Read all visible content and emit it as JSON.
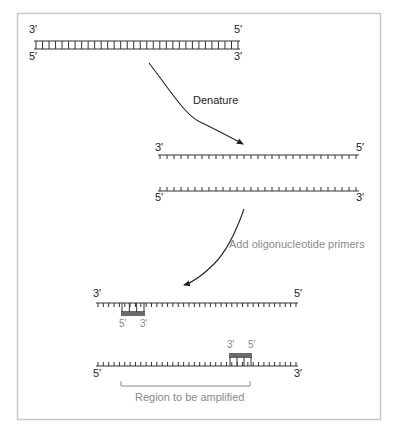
{
  "diagram": {
    "colors": {
      "strand": "#333333",
      "primer": "#6b6b6b",
      "frame": "#c8c8c8",
      "gray_text": "#8a8a8a"
    },
    "stage1": {
      "name": "double-stranded DNA",
      "top_left_label": "3′",
      "top_right_label": "5′",
      "bottom_left_label": "5′",
      "bottom_right_label": "3′",
      "base_pairs": 32
    },
    "step1": {
      "label": "Denature"
    },
    "stage2": {
      "name": "separated single strands",
      "strand_a": {
        "left_label": "3′",
        "right_label": "5′",
        "bases": 29
      },
      "strand_b": {
        "left_label": "5′",
        "right_label": "3′",
        "bases": 29
      }
    },
    "step2": {
      "label": "Add oligonucleotide primers"
    },
    "stage3": {
      "name": "strands with annealed primers",
      "strand_a": {
        "left_label": "3′",
        "right_label": "5′",
        "bases": 38,
        "primer": {
          "left_label": "5′",
          "right_label": "3′",
          "bases": 3
        }
      },
      "strand_b": {
        "left_label": "5′",
        "right_label": "3′",
        "bases": 38,
        "primer": {
          "left_label": "3′",
          "right_label": "5′",
          "bases": 3
        }
      },
      "region_label": "Region to be amplified"
    }
  }
}
